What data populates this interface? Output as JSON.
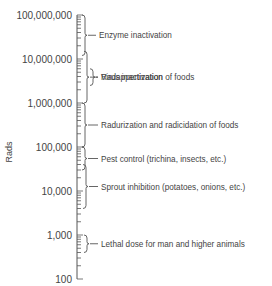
{
  "chart_data": {
    "type": "range-diagram",
    "title": "",
    "ylabel": "Rads",
    "yscale": "log",
    "ylim": [
      100,
      100000000
    ],
    "ticks": [
      {
        "value": 100000000,
        "label": "100,000,000"
      },
      {
        "value": 10000000,
        "label": "10,000,000"
      },
      {
        "value": 1000000,
        "label": "1,000,000"
      },
      {
        "value": 100000,
        "label": "100,000"
      },
      {
        "value": 10000,
        "label": "10,000"
      },
      {
        "value": 1000,
        "label": "1,000"
      },
      {
        "value": 100,
        "label": "100"
      }
    ],
    "ranges": [
      {
        "label": "Enzyme inactivation",
        "min": 12000000,
        "max": 100000000
      },
      {
        "label": "Virus inactivation",
        "min": 1000000,
        "max": 15000000
      },
      {
        "label": "Radappertization of foods",
        "min": 2500000,
        "max": 6000000
      },
      {
        "label": "Radurization and radicidation of foods",
        "min": 100000,
        "max": 1000000
      },
      {
        "label": "Pest control (trichina, insects, etc.)",
        "min": 30000,
        "max": 100000
      },
      {
        "label": "Sprout inhibition (potatoes, onions, etc.)",
        "min": 4000,
        "max": 40000
      },
      {
        "label": "Lethal dose for man and higher animals",
        "min": 400,
        "max": 1000
      }
    ]
  }
}
